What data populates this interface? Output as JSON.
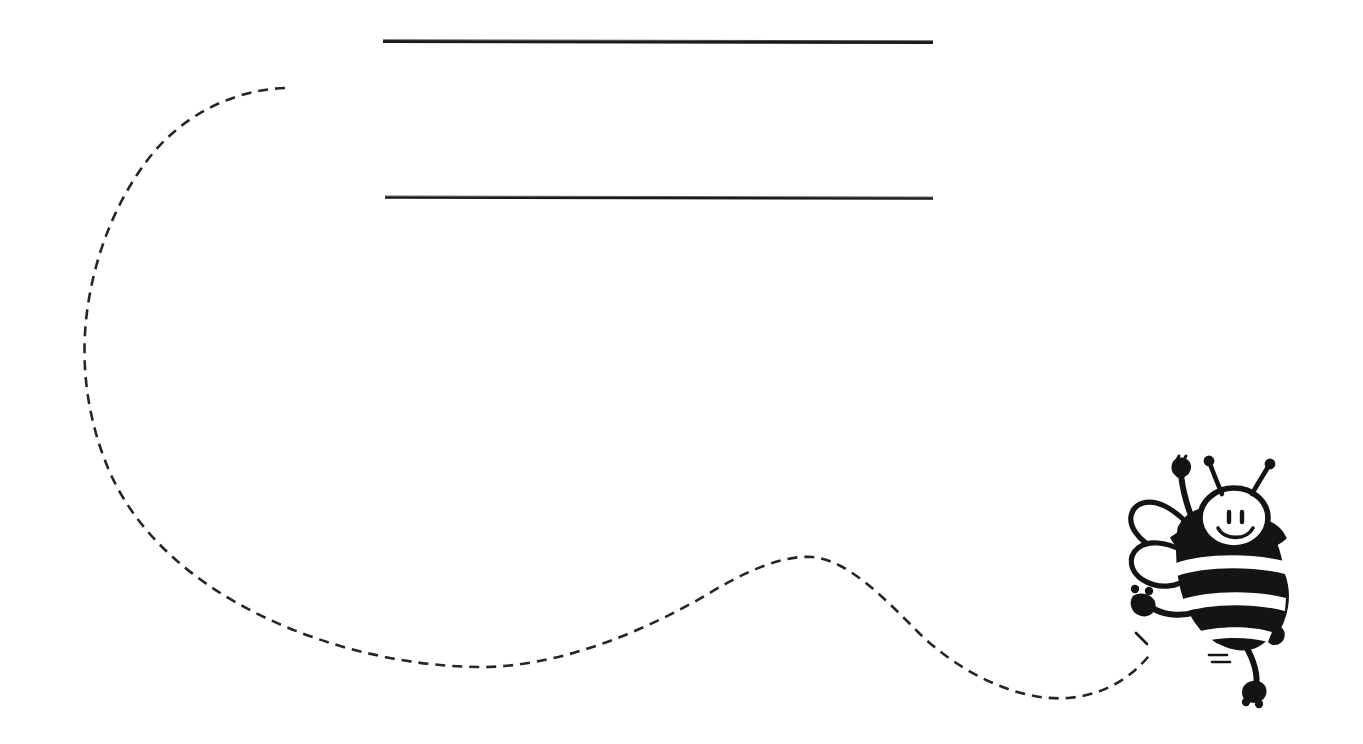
{
  "page": {
    "kind": "worksheet-template",
    "width": 744,
    "background_color": "#ffffff",
    "ink_color": "#1a1a1a",
    "title_text": "",
    "caption_text": ""
  },
  "writing_lines": [
    {
      "name": "writing-line-1",
      "value": "",
      "placeholder": "",
      "x1": 383,
      "y1": 41,
      "x2": 933,
      "y2": 42,
      "stroke_width": 3.0,
      "color": "#1a1a1a"
    },
    {
      "name": "writing-line-2",
      "value": "",
      "placeholder": "",
      "x1": 385,
      "y1": 197,
      "x2": 933,
      "y2": 198,
      "stroke_width": 2.6,
      "color": "#1a1a1a"
    }
  ],
  "flight_path": {
    "name": "dashed-flight-path",
    "style": "dashed",
    "color": "#262626",
    "stroke_width": 2.6,
    "dash_length": 10,
    "gap_length": 7,
    "path": "M 285 88 C 205 95 132 150 107 225 C 86 290 82 345 94 398 C 112 480 190 558 290 604 C 360 637 420 660 478 666 C 560 674 672 640 740 594 C 782 565 806 556 832 560 C 880 568 920 612 962 649 C 1004 686 1048 700 1086 696 C 1112 693 1135 676 1152 652",
    "key_points": [
      {
        "label": "start-upper-left",
        "x": 285,
        "y": 88
      },
      {
        "label": "left-apex",
        "x": 85,
        "y": 330
      },
      {
        "label": "first-trough",
        "x": 478,
        "y": 666
      },
      {
        "label": "mid-crest",
        "x": 822,
        "y": 559
      },
      {
        "label": "second-trough",
        "x": 1086,
        "y": 696
      },
      {
        "label": "end-at-bee-hand",
        "x": 1152,
        "y": 652
      }
    ]
  },
  "bee": {
    "name": "cartoon-bee",
    "color": "#141414",
    "fill_color": "#ffffff",
    "expression": "smiling",
    "pose": "waving-one-arm-raised",
    "bounds": {
      "x": 1118,
      "y": 452,
      "width": 180,
      "height": 245
    },
    "parts": [
      {
        "name": "bee-antenna-left",
        "label": "antenna"
      },
      {
        "name": "bee-antenna-right",
        "label": "antenna"
      },
      {
        "name": "bee-head",
        "label": "head"
      },
      {
        "name": "bee-eye-left",
        "label": "eye"
      },
      {
        "name": "bee-eye-right",
        "label": "eye"
      },
      {
        "name": "bee-smile",
        "label": "smile"
      },
      {
        "name": "bee-wing-upper",
        "label": "wing"
      },
      {
        "name": "bee-wing-lower",
        "label": "wing"
      },
      {
        "name": "bee-body",
        "label": "striped body"
      },
      {
        "name": "bee-stripe-1",
        "label": "white stripe"
      },
      {
        "name": "bee-stripe-2",
        "label": "white stripe"
      },
      {
        "name": "bee-stripe-3",
        "label": "white stripe"
      },
      {
        "name": "bee-arm-raised",
        "label": "raised arm"
      },
      {
        "name": "bee-arm-lower-left",
        "label": "lower left arm"
      },
      {
        "name": "bee-arm-right",
        "label": "right arm"
      },
      {
        "name": "bee-leg",
        "label": "leg"
      },
      {
        "name": "bee-foot",
        "label": "foot"
      },
      {
        "name": "bee-motion-marks",
        "label": "motion dashes"
      }
    ],
    "stripe_count": 3
  }
}
